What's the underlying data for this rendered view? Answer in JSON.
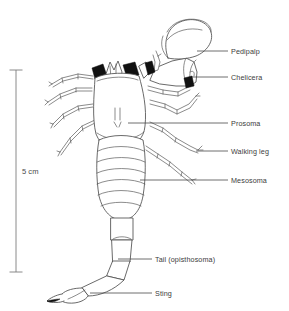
{
  "figure": {
    "view": "dorsal",
    "background_color": "#ffffff",
    "line_color": "#4f4f4f",
    "text_color": "#3c3c3c",
    "accent_color": "#111111"
  },
  "scale": {
    "label": "5 cm",
    "bar_color": "#7d7d7d",
    "orientation": "vertical"
  },
  "labels": [
    {
      "id": "pedipalp",
      "text": "Pedipalp"
    },
    {
      "id": "chelicera",
      "text": "Chelicera"
    },
    {
      "id": "prosoma",
      "text": "Prosoma"
    },
    {
      "id": "walkingleg",
      "text": "Walking leg"
    },
    {
      "id": "mesosoma",
      "text": "Mesosoma"
    },
    {
      "id": "tail",
      "text": "Tail (opisthosoma)"
    },
    {
      "id": "sting",
      "text": "Sting"
    }
  ]
}
